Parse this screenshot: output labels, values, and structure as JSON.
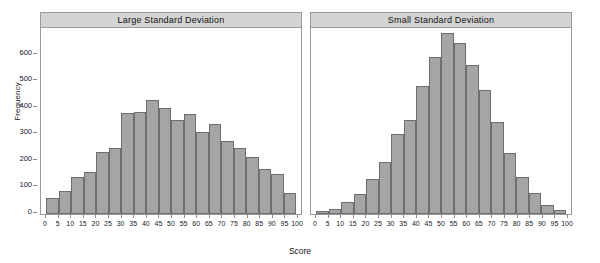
{
  "chart_data": {
    "type": "bar",
    "title": "",
    "xlabel": "Score",
    "ylabel": "Frequency",
    "xlim": [
      0,
      100
    ],
    "ylim": [
      0,
      700
    ],
    "yticks": [
      0,
      100,
      200,
      300,
      400,
      500,
      600
    ],
    "xticks": [
      0,
      5,
      10,
      15,
      20,
      25,
      30,
      35,
      40,
      45,
      50,
      55,
      60,
      65,
      70,
      75,
      80,
      85,
      90,
      95,
      100
    ],
    "grid": false,
    "legend": false,
    "bar_fill_color": "#a5a5a5",
    "bar_edge_color": "#6e6e6e",
    "panel_strip_color": "#d4d4d4",
    "panels": [
      {
        "id": "large-sd",
        "title": "Large Standard Deviation",
        "categories": [
          0,
          5,
          10,
          15,
          20,
          25,
          30,
          35,
          40,
          45,
          50,
          55,
          60,
          65,
          70,
          75,
          80,
          85,
          90,
          95
        ],
        "bin_labels": [
          "0-5",
          "5-10",
          "10-15",
          "15-20",
          "20-25",
          "25-30",
          "30-35",
          "35-40",
          "40-45",
          "45-50",
          "50-55",
          "55-60",
          "60-65",
          "65-70",
          "70-75",
          "75-80",
          "80-85",
          "85-90",
          "90-95",
          "95-100"
        ],
        "values": [
          60,
          85,
          140,
          160,
          235,
          250,
          380,
          385,
          430,
          400,
          355,
          375,
          310,
          340,
          275,
          250,
          215,
          170,
          150,
          80
        ]
      },
      {
        "id": "small-sd",
        "title": "Small Standard Deviation",
        "categories": [
          0,
          5,
          10,
          15,
          20,
          25,
          30,
          35,
          40,
          45,
          50,
          55,
          60,
          65,
          70,
          75,
          80,
          85,
          90,
          95
        ],
        "bin_labels": [
          "0-5",
          "5-10",
          "10-15",
          "15-20",
          "20-25",
          "25-30",
          "30-35",
          "35-40",
          "40-45",
          "45-50",
          "50-55",
          "55-60",
          "60-65",
          "65-70",
          "70-75",
          "75-80",
          "80-85",
          "85-90",
          "90-95",
          "95-100"
        ],
        "values": [
          10,
          20,
          45,
          75,
          130,
          195,
          300,
          355,
          480,
          590,
          680,
          645,
          560,
          465,
          345,
          230,
          140,
          80,
          35,
          15
        ]
      }
    ]
  },
  "axis": {
    "y_title": "Frequency",
    "x_title": "Score"
  }
}
